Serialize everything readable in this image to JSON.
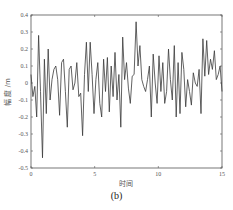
{
  "chart_data": {
    "type": "line",
    "title": "",
    "xlabel": "时间",
    "ylabel": "幅 度 /m",
    "xlim": [
      0,
      15
    ],
    "ylim": [
      -0.5,
      0.4
    ],
    "xticks": [
      0,
      5,
      10,
      15
    ],
    "xtick_labels": [
      "0",
      "5",
      "10",
      "15"
    ],
    "yticks": [
      0.4,
      0.3,
      0.2,
      0.1,
      0,
      -0.1,
      -0.2,
      -0.3,
      -0.4,
      -0.5
    ],
    "ytick_labels": [
      "0.4",
      "0.3",
      "0.2",
      "0.1",
      "0",
      "-0.1",
      "-0.2",
      "-0.3",
      "-0.4",
      "-0.5"
    ],
    "grid": false,
    "legend": null,
    "caption": "(b)",
    "series": [
      {
        "name": "wave elevation",
        "x": [
          0.0,
          0.15,
          0.3,
          0.45,
          0.6,
          0.75,
          0.9,
          1.05,
          1.2,
          1.35,
          1.5,
          1.65,
          1.8,
          1.95,
          2.1,
          2.25,
          2.4,
          2.55,
          2.7,
          2.85,
          3.0,
          3.15,
          3.3,
          3.45,
          3.6,
          3.75,
          3.9,
          4.05,
          4.2,
          4.35,
          4.5,
          4.65,
          4.8,
          4.95,
          5.1,
          5.25,
          5.4,
          5.55,
          5.7,
          5.85,
          6.0,
          6.15,
          6.3,
          6.45,
          6.6,
          6.75,
          6.9,
          7.05,
          7.2,
          7.35,
          7.5,
          7.65,
          7.8,
          7.95,
          8.1,
          8.25,
          8.4,
          8.55,
          8.7,
          8.85,
          9.0,
          9.15,
          9.3,
          9.45,
          9.6,
          9.75,
          9.9,
          10.05,
          10.2,
          10.35,
          10.5,
          10.65,
          10.8,
          10.95,
          11.1,
          11.25,
          11.4,
          11.55,
          11.7,
          11.85,
          12.0,
          12.15,
          12.3,
          12.45,
          12.6,
          12.75,
          12.9,
          13.05,
          13.2,
          13.35,
          13.5,
          13.65,
          13.8,
          13.95,
          14.1,
          14.25,
          14.4,
          14.55,
          14.7,
          14.85,
          15.0
        ],
        "values": [
          0.05,
          -0.08,
          -0.02,
          -0.2,
          0.28,
          -0.05,
          -0.44,
          0.14,
          -0.18,
          0.2,
          -0.1,
          0.02,
          0.08,
          0.1,
          0.02,
          -0.19,
          0.12,
          0.14,
          -0.05,
          -0.26,
          0.08,
          0.1,
          -0.04,
          0.0,
          0.12,
          -0.08,
          -0.06,
          -0.31,
          0.05,
          0.24,
          -0.05,
          0.24,
          0.05,
          -0.18,
          0.02,
          0.12,
          -0.12,
          -0.2,
          0.14,
          -0.05,
          0.15,
          -0.17,
          0.1,
          -0.08,
          0.18,
          -0.1,
          0.05,
          -0.26,
          0.27,
          0.02,
          0.12,
          -0.03,
          -0.12,
          0.04,
          0.05,
          0.36,
          0.1,
          0.22,
          0.02,
          -0.02,
          -0.05,
          0.02,
          0.1,
          -0.2,
          0.17,
          0.0,
          -0.12,
          0.16,
          -0.05,
          0.12,
          -0.12,
          -0.05,
          0.2,
          0.02,
          -0.1,
          0.22,
          -0.2,
          0.12,
          -0.18,
          0.18,
          0.08,
          -0.14,
          0.02,
          -0.05,
          -0.13,
          0.06,
          0.0,
          -0.02,
          0.08,
          -0.18,
          0.26,
          0.04,
          0.25,
          0.05,
          0.14,
          0.08,
          0.19,
          0.02,
          0.05,
          0.1,
          -0.05
        ]
      }
    ]
  },
  "caption": "(b)",
  "axes": {
    "xlabel": "时间",
    "ylabel": "幅 度 /m"
  }
}
